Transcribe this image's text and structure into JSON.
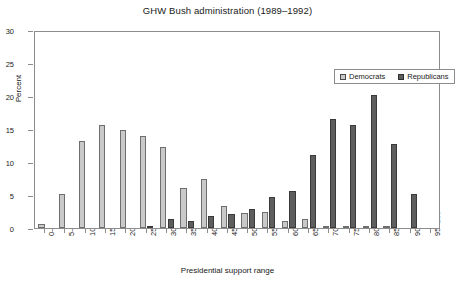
{
  "chart_data": {
    "type": "bar",
    "title": "GHW Bush administration (1989–1992)",
    "xlabel": "Presidential support range",
    "ylabel": "Percent",
    "ylim": [
      0,
      30
    ],
    "yticks": [
      0,
      5,
      10,
      15,
      20,
      25,
      30
    ],
    "grid": false,
    "legend_position": "top-right",
    "categories": [
      "0–5",
      "5–10",
      "10–15",
      "15–20",
      "20–25",
      "25–30",
      "30–35",
      "35–40",
      "40–45",
      "45–50",
      "50–55",
      "55–60",
      "60–65",
      "65–70",
      "70–75",
      "75–80",
      "80–85",
      "85–90",
      "90–95",
      "95–100"
    ],
    "series": [
      {
        "name": "Democrats",
        "color": "#c9c9c9",
        "values": [
          0.6,
          5.1,
          13.2,
          15.6,
          14.8,
          14.0,
          12.3,
          6.1,
          7.4,
          3.3,
          2.2,
          2.5,
          1.1,
          1.3,
          0.2,
          0.1,
          0.1,
          0.1,
          0.0,
          0.0
        ]
      },
      {
        "name": "Republicans",
        "color": "#5e5e5e",
        "values": [
          0.0,
          0.0,
          0.0,
          0.0,
          0.0,
          0.2,
          1.3,
          1.1,
          1.8,
          2.1,
          2.9,
          4.7,
          5.6,
          11.1,
          16.5,
          15.6,
          20.1,
          12.7,
          5.2,
          0.0
        ]
      }
    ]
  },
  "legend": {
    "items": [
      {
        "label": "Democrats",
        "key": "dem"
      },
      {
        "label": "Republicans",
        "key": "rep"
      }
    ]
  }
}
